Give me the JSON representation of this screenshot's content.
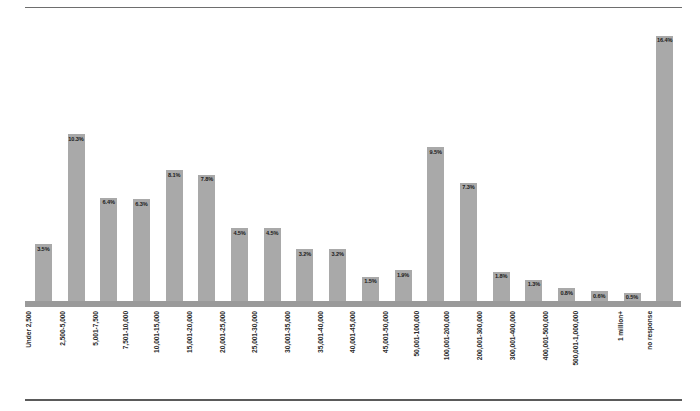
{
  "chart_data": {
    "type": "bar",
    "title": "",
    "subtitle": "",
    "xlabel": "",
    "ylabel": "",
    "ylim": [
      0,
      17.5
    ],
    "grid": false,
    "legend": false,
    "value_suffix": "%",
    "categories": [
      "Under 2,500",
      "2,500-5,000",
      "5,001-7,500",
      "7,501-10,000",
      "10,001-15,000",
      "15,001-20,000",
      "20,001-25,000",
      "25,001-30,000",
      "30,001-35,000",
      "35,001-40,000",
      "40,001-45,000",
      "45,001-50,000",
      "50,001-100,000",
      "100,001-200,000",
      "200,001-300,000",
      "300,001-400,000",
      "400,001-500,000",
      "500,001-1,000,000",
      "1 million+",
      "no response"
    ],
    "values": [
      3.5,
      10.3,
      6.4,
      6.3,
      8.1,
      7.8,
      4.5,
      4.5,
      3.2,
      3.2,
      1.5,
      1.9,
      9.5,
      7.3,
      1.8,
      1.3,
      0.8,
      0.6,
      0.5,
      16.4
    ],
    "value_labels": [
      "3.5%",
      "10.3%",
      "6.4%",
      "6.3%",
      "8.1%",
      "7.8%",
      "4.5%",
      "4.5%",
      "3.2%",
      "3.2%",
      "1.5%",
      "1.9%",
      "9.5%",
      "7.3%",
      "1.8%",
      "1.3%",
      "0.8%",
      "0.6%",
      "0.5%",
      "16.4%"
    ],
    "bar_color": "#a9a9a9",
    "axis_color": "#9a9a9a",
    "label_color": "#2b2b2b"
  }
}
